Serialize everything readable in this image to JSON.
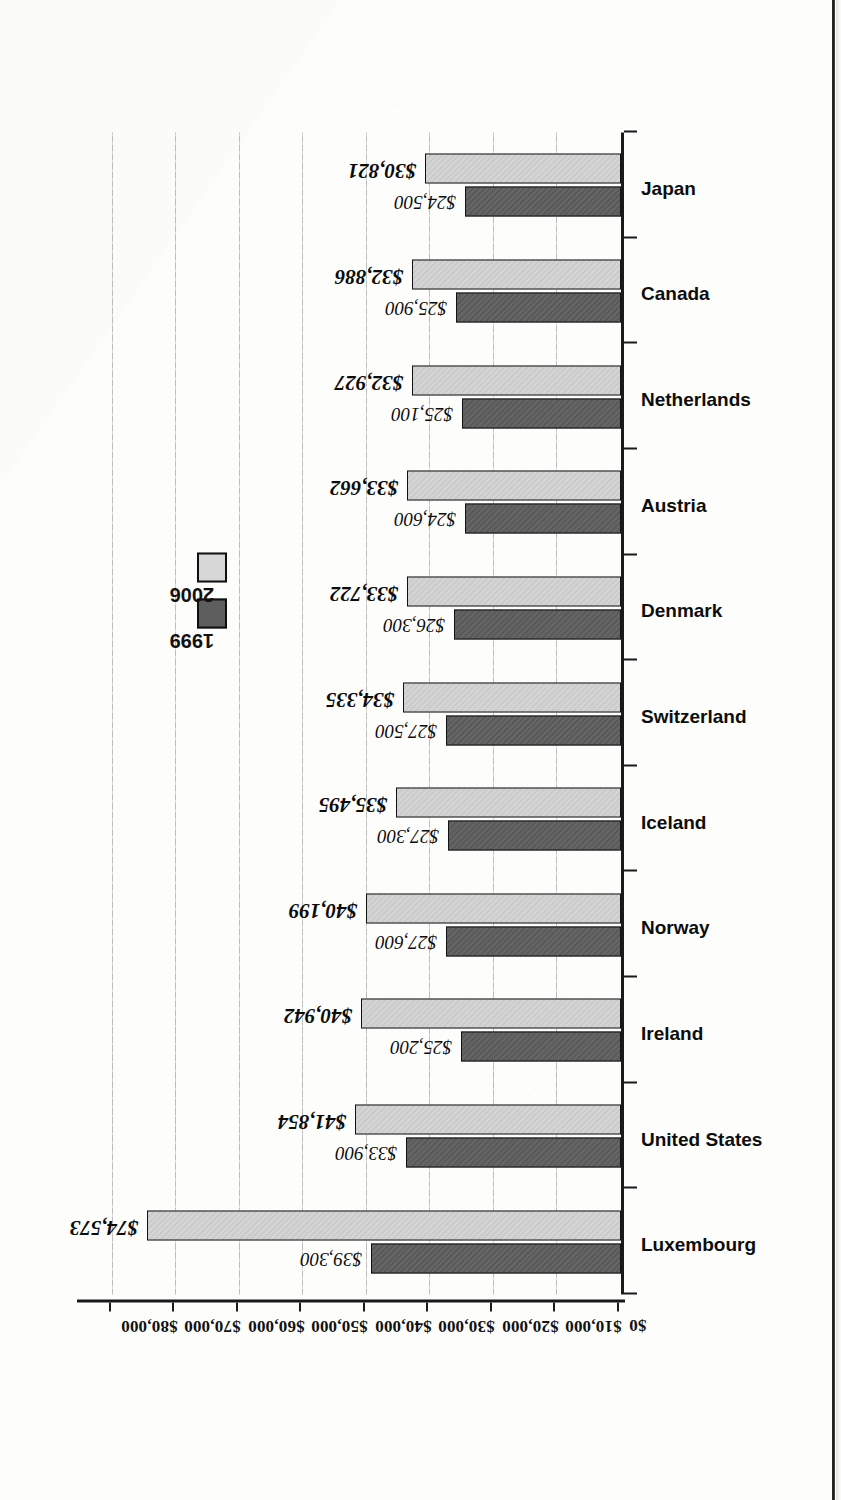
{
  "chart_data": {
    "type": "bar",
    "title": "",
    "xlabel": "",
    "ylabel": "",
    "orientation": "vertical-bars-rotated-90ccw-on-page",
    "grid": true,
    "legend_position": "upper-right",
    "ylim": [
      0,
      85000
    ],
    "yticks": [
      0,
      10000,
      20000,
      30000,
      40000,
      50000,
      60000,
      70000,
      80000
    ],
    "ytick_labels": [
      "$0",
      "$10,000",
      "$20,000",
      "$30,000",
      "$40,000",
      "$50,000",
      "$60,000",
      "$70,000",
      "$80,000"
    ],
    "categories": [
      "Luxembourg",
      "United States",
      "Ireland",
      "Norway",
      "Iceland",
      "Switzerland",
      "Denmark",
      "Austria",
      "Netherlands",
      "Canada",
      "Japan"
    ],
    "series": [
      {
        "name": "1999",
        "color": "#5e5e5e",
        "values": [
          39300,
          33900,
          25200,
          27600,
          27300,
          27500,
          26300,
          24600,
          25100,
          25900,
          24500
        ],
        "labels": [
          "$39,300",
          "$33,900",
          "$25,200",
          "$27,600",
          "$27,300",
          "$27,500",
          "$26,300",
          "$24,600",
          "$25,100",
          "$25,900",
          "$24,500"
        ]
      },
      {
        "name": "2006",
        "color": "#d3d3d3",
        "values": [
          74573,
          41854,
          40942,
          40199,
          35495,
          34335,
          33722,
          33662,
          32927,
          32886,
          30821
        ],
        "labels": [
          "$74,573",
          "$41,854",
          "$40,942",
          "$40,199",
          "$35,495",
          "$34,335",
          "$33,722",
          "$33,662",
          "$32,927",
          "$32,886",
          "$30,821"
        ]
      }
    ]
  },
  "legend": {
    "items": [
      {
        "label": "1999",
        "color": "#5e5e5e"
      },
      {
        "label": "2006",
        "color": "#d3d3d3"
      }
    ]
  }
}
